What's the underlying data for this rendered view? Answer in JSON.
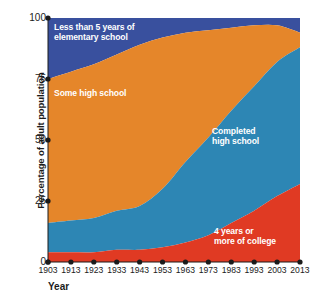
{
  "chart_data": {
    "type": "area",
    "stacked": true,
    "title": "",
    "xlabel": "Year",
    "ylabel": "Percentage of adult population",
    "x": [
      1903,
      1913,
      1923,
      1933,
      1943,
      1953,
      1963,
      1973,
      1983,
      1993,
      2003,
      2013
    ],
    "xtick_labels": [
      "1903",
      "1913",
      "1923",
      "1933",
      "1943",
      "1953",
      "1963",
      "1973",
      "1983",
      "1993",
      "2003",
      "2013"
    ],
    "ytick_labels": [
      "0",
      "25",
      "50",
      "75",
      "100"
    ],
    "yticks": [
      0,
      25,
      50,
      75,
      100
    ],
    "ylim": [
      0,
      100
    ],
    "xlim": [
      1903,
      2013
    ],
    "grid": false,
    "legend": "in-plot labels",
    "series": [
      {
        "name": "4 years or more of college",
        "color": "#e03a23",
        "values": [
          4,
          4,
          4,
          5,
          5,
          6,
          8,
          11,
          16,
          21,
          27,
          32
        ]
      },
      {
        "name": "Completed high school",
        "color": "#2d86b4",
        "values": [
          12,
          13,
          14,
          16,
          18,
          24,
          33,
          40,
          46,
          51,
          55,
          56
        ]
      },
      {
        "name": "Some high school",
        "color": "#e5862a",
        "values": [
          59,
          61,
          63,
          64,
          66,
          62,
          53,
          44,
          34,
          25,
          15,
          6
        ]
      },
      {
        "name": "Less than 5 years of elementary school",
        "color": "#39509e",
        "values": [
          25,
          22,
          19,
          15,
          11,
          8,
          6,
          5,
          4,
          3,
          3,
          6
        ]
      }
    ],
    "cumulative_boundaries": {
      "college_top": [
        4,
        4,
        4,
        5,
        5,
        6,
        8,
        11,
        16,
        21,
        27,
        32
      ],
      "highschool_top": [
        16,
        17,
        18,
        21,
        23,
        30,
        41,
        51,
        62,
        72,
        82,
        88
      ],
      "somehs_top": [
        75,
        78,
        81,
        85,
        89,
        92,
        94,
        95,
        96,
        97,
        97,
        94
      ],
      "elementary_top": [
        100,
        100,
        100,
        100,
        100,
        100,
        100,
        100,
        100,
        100,
        100,
        100
      ]
    }
  },
  "axes": {
    "y_axis_label": "Percentage of adult population",
    "x_axis_label": "Year",
    "y_tick_labels": [
      "100",
      "75",
      "50",
      "25",
      "0"
    ],
    "x_tick_labels": [
      "1903",
      "1913",
      "1923",
      "1933",
      "1943",
      "1953",
      "1963",
      "1973",
      "1983",
      "1993",
      "2003",
      "2013"
    ]
  },
  "series_labels": {
    "elementary": "Less than 5 years of\nelementary school",
    "some_high_school": "Some high school",
    "completed_high_school": "Completed\nhigh school",
    "college": "4 years or\nmore of college"
  },
  "colors": {
    "elementary": "#39509e",
    "some_high_school": "#e5862a",
    "completed_high_school": "#2d86b4",
    "college": "#e03a23",
    "axis": "#1b1b1b",
    "background": "#ffffff",
    "label_text": "#ffffff"
  }
}
